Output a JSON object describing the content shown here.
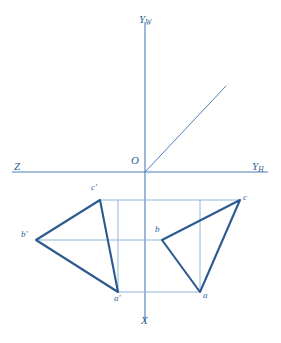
{
  "figure": {
    "background_color": "#ffffff",
    "width": 281,
    "height": 343,
    "colors": {
      "axis": "#4c7fb8",
      "bisector": "#5182ba",
      "projector": "#89aed2",
      "triangle": "#2c5b91",
      "label": "#2f5f96"
    }
  },
  "axes": {
    "vertical_top": {
      "label": "Y",
      "subscript": "W",
      "x": 145,
      "y1": 22,
      "y2": 322
    },
    "horizontal": {
      "x1": 12,
      "x2": 268,
      "y": 172
    },
    "left_label": {
      "label": "Z",
      "subscript": "",
      "x": 14,
      "y": 166
    },
    "right_label": {
      "label": "Y",
      "subscript": "H",
      "x": 252,
      "y": 166
    },
    "bottom_label": {
      "label": "X",
      "subscript": "",
      "x": 141,
      "y": 318
    },
    "top_label_pos": {
      "x": 139,
      "y": 14
    },
    "origin": {
      "label": "O",
      "x": 145,
      "y": 172,
      "label_x": 131,
      "label_y": 158
    }
  },
  "bisector": {
    "name": "45-degree-bisector",
    "x1": 145,
    "y1": 172,
    "x2": 226,
    "y2": 86
  },
  "projectors": [
    {
      "name": "projector-c",
      "x1": 100,
      "y1": 200,
      "x2": 240,
      "y2": 200
    },
    {
      "name": "projector-b",
      "x1": 36,
      "y1": 240,
      "x2": 162,
      "y2": 240
    },
    {
      "name": "projector-a",
      "x1": 118,
      "y1": 292,
      "x2": 200,
      "y2": 292
    },
    {
      "name": "projector-vertical-left",
      "x1": 118,
      "y1": 200,
      "x2": 118,
      "y2": 292
    },
    {
      "name": "projector-vertical-right",
      "x1": 200,
      "y1": 200,
      "x2": 200,
      "y2": 292
    }
  ],
  "triangles": [
    {
      "name": "frontal-projection-triangle",
      "points": "100,200 36,240 118,292",
      "vertices": [
        {
          "label": "c'",
          "x": 100,
          "y": 200,
          "label_x": 91,
          "label_y": 186
        },
        {
          "label": "b'",
          "x": 36,
          "y": 240,
          "label_x": 21,
          "label_y": 233
        },
        {
          "label": "a'",
          "x": 118,
          "y": 292,
          "label_x": 114,
          "label_y": 296
        }
      ]
    },
    {
      "name": "horizontal-projection-triangle",
      "points": "240,200 162,240 200,292",
      "vertices": [
        {
          "label": "c",
          "x": 240,
          "y": 200,
          "label_x": 243,
          "label_y": 196
        },
        {
          "label": "b",
          "x": 162,
          "y": 240,
          "label_x": 155,
          "label_y": 227
        },
        {
          "label": "a",
          "x": 200,
          "y": 292,
          "label_x": 203,
          "label_y": 293
        }
      ]
    }
  ]
}
